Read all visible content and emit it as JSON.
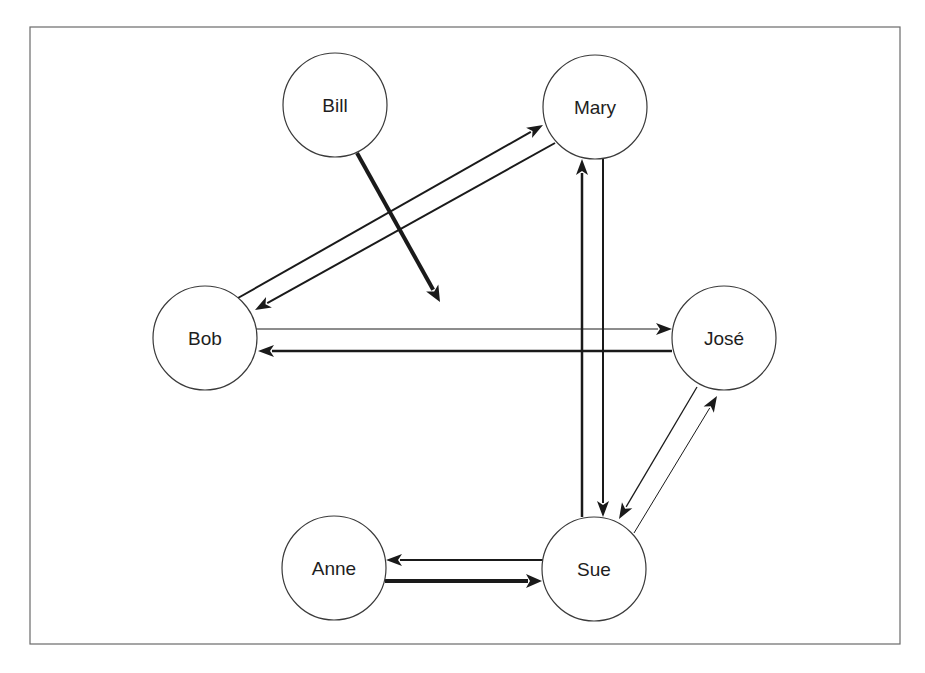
{
  "diagram": {
    "type": "directed-graph",
    "frame": {
      "x": 30,
      "y": 27,
      "width": 870,
      "height": 617
    },
    "node_radius": 52,
    "nodes": [
      {
        "id": "bill",
        "label": "Bill",
        "cx": 335,
        "cy": 105
      },
      {
        "id": "mary",
        "label": "Mary",
        "cx": 595,
        "cy": 107
      },
      {
        "id": "bob",
        "label": "Bob",
        "cx": 205,
        "cy": 338
      },
      {
        "id": "jose",
        "label": "José",
        "cx": 724,
        "cy": 338
      },
      {
        "id": "anne",
        "label": "Anne",
        "cx": 334,
        "cy": 568
      },
      {
        "id": "sue",
        "label": "Sue",
        "cx": 594,
        "cy": 569
      }
    ],
    "edges": [
      {
        "from": "bill",
        "to": "",
        "x1": 357,
        "y1": 153,
        "x2": 440,
        "y2": 302,
        "width": 4
      },
      {
        "from": "bob",
        "to": "mary",
        "x1": 238,
        "y1": 298,
        "x2": 543,
        "y2": 125,
        "width": 2
      },
      {
        "from": "mary",
        "to": "bob",
        "x1": 555,
        "y1": 143,
        "x2": 255,
        "y2": 310,
        "width": 2
      },
      {
        "from": "bob",
        "to": "jose",
        "x1": 256,
        "y1": 329,
        "x2": 672,
        "y2": 329,
        "width": 1
      },
      {
        "from": "jose",
        "to": "bob",
        "x1": 672,
        "y1": 351,
        "x2": 258,
        "y2": 351,
        "width": 2.5
      },
      {
        "from": "sue",
        "to": "mary",
        "x1": 582,
        "y1": 517,
        "x2": 582,
        "y2": 159,
        "width": 2.5
      },
      {
        "from": "mary",
        "to": "sue",
        "x1": 603,
        "y1": 159,
        "x2": 603,
        "y2": 517,
        "width": 2
      },
      {
        "from": "jose",
        "to": "sue",
        "x1": 697,
        "y1": 387,
        "x2": 619,
        "y2": 519,
        "width": 1.3
      },
      {
        "from": "sue",
        "to": "jose",
        "x1": 634,
        "y1": 533,
        "x2": 717,
        "y2": 396,
        "width": 1
      },
      {
        "from": "sue",
        "to": "anne",
        "x1": 543,
        "y1": 560,
        "x2": 386,
        "y2": 560,
        "width": 2
      },
      {
        "from": "anne",
        "to": "sue",
        "x1": 385,
        "y1": 581,
        "x2": 542,
        "y2": 581,
        "width": 4
      }
    ]
  }
}
